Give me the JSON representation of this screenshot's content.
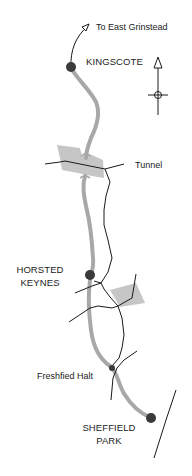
{
  "map": {
    "title": "Bluebell Railway route map",
    "colors": {
      "railway": "#a8a8a8",
      "station": "#3a3a3a",
      "road": "#1a1a1a",
      "shaded_area": "#c4c4c4",
      "text": "#222222",
      "background": "#ffffff"
    },
    "direction_label": "To East Grinstead",
    "north_arrow": {
      "icon": "north-arrow-icon"
    },
    "stations": [
      {
        "id": "kingscote",
        "label": "KINGSCOTE",
        "type": "major"
      },
      {
        "id": "horsted-keynes",
        "label_line1": "HORSTED",
        "label_line2": "KEYNES",
        "type": "major"
      },
      {
        "id": "freshfield-halt",
        "label": "Freshfied Halt",
        "type": "halt"
      },
      {
        "id": "sheffield-park",
        "label_line1": "SHEFFIELD",
        "label_line2": "PARK",
        "type": "major"
      }
    ],
    "features": [
      {
        "id": "tunnel",
        "label": "Tunnel"
      }
    ]
  }
}
